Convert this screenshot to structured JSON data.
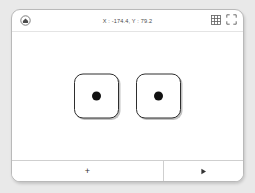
{
  "window": {
    "background_color": "#e9e9e9",
    "panel_color": "#ffffff",
    "border_color": "#b9b9b9"
  },
  "titlebar": {
    "home_icon": "home-circle-icon",
    "coordinates": "X : -174.4, Y : 79.2",
    "actions": [
      {
        "name": "grid-icon",
        "label": "grid"
      },
      {
        "name": "fullscreen-icon",
        "label": "fullscreen"
      }
    ]
  },
  "canvas": {
    "nodes": [
      {
        "name": "node-card-1",
        "dot_color": "#111111"
      },
      {
        "name": "node-card-2",
        "dot_color": "#111111"
      }
    ]
  },
  "toolbar": {
    "add_label": "+",
    "play_label": "▶"
  }
}
